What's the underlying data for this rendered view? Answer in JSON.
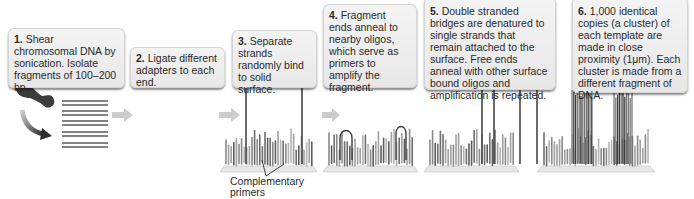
{
  "steps": [
    {
      "num": "1.",
      "text": " Shear chromosomal DNA by sonication. Isolate fragments of 100–200 bp."
    },
    {
      "num": "2.",
      "text": " Ligate different adapters to each end."
    },
    {
      "num": "3.",
      "text": " Separate strands randomly bind to solid surface."
    },
    {
      "num": "4.",
      "text": " Fragment ends anneal to nearby oligos, which serve as primers to amplify the fragment."
    },
    {
      "num": "5.",
      "text": " Double stranded bridges are denatured to single strands that remain attached to the surface. Free ends anneal with other surface bound oligos and amplification is repeated."
    },
    {
      "num": "6.",
      "text": " 1,000 identical copies (a cluster) of each template are made in close proximity (1μm). Each cluster is made from a different fragment of DNA."
    }
  ],
  "annotations": {
    "complementary_primers": "Complementary primers"
  },
  "colors": {
    "box_bg": "#ececec",
    "strand": "#555555",
    "adapter": "#2e2e2e",
    "arrow": "#c8c8c8",
    "surface": "#e4e4e4"
  }
}
